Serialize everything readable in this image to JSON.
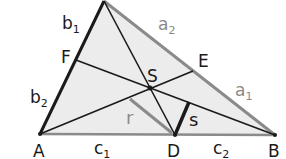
{
  "diagram": {
    "type": "triangle-geometry",
    "vertices": {
      "A": {
        "label": "A",
        "x": 40,
        "y": 134
      },
      "B": {
        "label": "B",
        "x": 275,
        "y": 135
      },
      "C": {
        "label": "",
        "x": 104,
        "y": 1
      }
    },
    "points": {
      "D": {
        "label": "D",
        "x": 175,
        "y": 135
      },
      "E": {
        "label": "E",
        "x": 193,
        "y": 71
      },
      "F": {
        "label": "F",
        "x": 76,
        "y": 60
      },
      "S": {
        "label": "S",
        "x": 150,
        "y": 88
      }
    },
    "segment_labels": {
      "b1": {
        "base": "b",
        "sub": "1"
      },
      "b2": {
        "base": "b",
        "sub": "2"
      },
      "a1": {
        "base": "a",
        "sub": "1"
      },
      "a2": {
        "base": "a",
        "sub": "2"
      },
      "c1": {
        "base": "c",
        "sub": "1"
      },
      "c2": {
        "base": "c",
        "sub": "2"
      },
      "r": {
        "base": "r"
      },
      "s": {
        "base": "s"
      }
    },
    "colors": {
      "fill": "#ececec",
      "dark_line": "#1a1a1a",
      "gray_line": "#8a8a8a",
      "label_gray": "#8a8a8a"
    }
  }
}
